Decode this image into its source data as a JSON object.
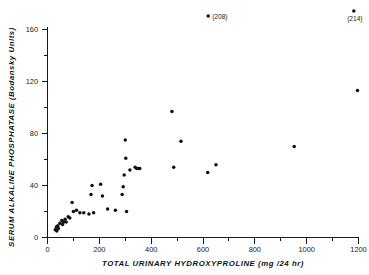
{
  "chart_data": {
    "type": "scatter",
    "title": "",
    "xlabel": "TOTAL URINARY HYDROXYPROLINE (mg /24 hr)",
    "ylabel": "SERUM ALKALINE PHOSPHATASE (Bodansky Units)",
    "xlim": [
      0,
      1250
    ],
    "ylim": [
      0,
      170
    ],
    "xticks": [
      0,
      200,
      400,
      600,
      800,
      1000,
      1200
    ],
    "xticklabels": [
      "0",
      "200",
      "400",
      "600",
      "800",
      "1000",
      "1200"
    ],
    "yticks": [
      0,
      40,
      80,
      120,
      160
    ],
    "yticklabels": [
      "0",
      "40",
      "80",
      "120",
      "160"
    ],
    "y_minor_ticks": [
      20,
      60,
      100,
      140
    ],
    "x_minor_ticks": [
      100,
      300,
      500,
      700,
      900,
      1100
    ],
    "grid": false,
    "legend": null,
    "marker": "filled-circle",
    "marker_color": "#111111",
    "points": [
      {
        "x": 30,
        "y": 6
      },
      {
        "x": 34,
        "y": 8
      },
      {
        "x": 36,
        "y": 5
      },
      {
        "x": 40,
        "y": 9
      },
      {
        "x": 42,
        "y": 7
      },
      {
        "x": 48,
        "y": 11
      },
      {
        "x": 55,
        "y": 13
      },
      {
        "x": 58,
        "y": 10
      },
      {
        "x": 62,
        "y": 12
      },
      {
        "x": 68,
        "y": 14
      },
      {
        "x": 72,
        "y": 12
      },
      {
        "x": 80,
        "y": 16
      },
      {
        "x": 86,
        "y": 15
      },
      {
        "x": 95,
        "y": 27
      },
      {
        "x": 100,
        "y": 20
      },
      {
        "x": 112,
        "y": 21
      },
      {
        "x": 125,
        "y": 19
      },
      {
        "x": 140,
        "y": 19
      },
      {
        "x": 160,
        "y": 18
      },
      {
        "x": 168,
        "y": 33
      },
      {
        "x": 172,
        "y": 40
      },
      {
        "x": 178,
        "y": 19
      },
      {
        "x": 205,
        "y": 41
      },
      {
        "x": 212,
        "y": 32
      },
      {
        "x": 232,
        "y": 22
      },
      {
        "x": 262,
        "y": 21
      },
      {
        "x": 288,
        "y": 33
      },
      {
        "x": 292,
        "y": 39
      },
      {
        "x": 296,
        "y": 48
      },
      {
        "x": 300,
        "y": 75
      },
      {
        "x": 302,
        "y": 61
      },
      {
        "x": 305,
        "y": 20
      },
      {
        "x": 318,
        "y": 52
      },
      {
        "x": 338,
        "y": 54
      },
      {
        "x": 344,
        "y": 53
      },
      {
        "x": 350,
        "y": 53
      },
      {
        "x": 356,
        "y": 53
      },
      {
        "x": 480,
        "y": 97
      },
      {
        "x": 487,
        "y": 54
      },
      {
        "x": 515,
        "y": 74
      },
      {
        "x": 618,
        "y": 50
      },
      {
        "x": 650,
        "y": 56
      },
      {
        "x": 952,
        "y": 70
      },
      {
        "x": 1196,
        "y": 113
      }
    ],
    "offscale_points": [
      {
        "x": 620,
        "label": "(208)",
        "value": 208
      },
      {
        "x": 1182,
        "label": "(214)",
        "value": 214
      }
    ],
    "annotations": [
      {
        "text": "(208)",
        "note": "off-scale point plotted above axis at x 620"
      },
      {
        "text": "(214)",
        "note": "off-scale point plotted above axis at x 1182"
      }
    ]
  }
}
